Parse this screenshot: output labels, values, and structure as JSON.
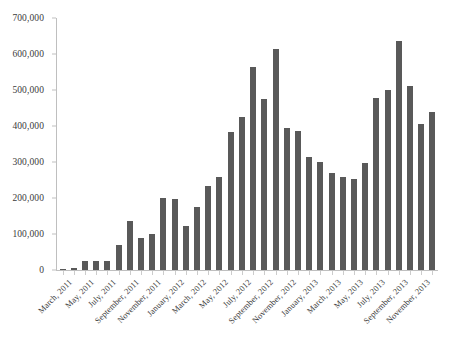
{
  "chart_data": {
    "type": "bar",
    "title": "",
    "subtitle": "",
    "xlabel": "",
    "ylabel": "",
    "ylim": [
      0,
      700000
    ],
    "ytick_values": [
      0,
      100000,
      200000,
      300000,
      400000,
      500000,
      600000,
      700000
    ],
    "ytick_labels": [
      "0",
      "100,000",
      "200,000",
      "300,000",
      "400,000",
      "500,000",
      "600,000",
      "700,000"
    ],
    "grid": false,
    "legend": null,
    "legend_position": "none",
    "bar_color": "#595959",
    "axis_color": "#bfbfbf",
    "text_color": "#3b3b3b",
    "categories": [
      "March, 2011",
      "April, 2011",
      "May, 2011",
      "June, 2011",
      "July, 2011",
      "August, 2011",
      "September, 2011",
      "October, 2011",
      "November, 2011",
      "December, 2011",
      "January, 2012",
      "February, 2012",
      "March, 2012",
      "April, 2012",
      "May, 2012",
      "June, 2012",
      "July, 2012",
      "August, 2012",
      "September, 2012",
      "October, 2012",
      "November, 2012",
      "December, 2012",
      "January, 2013",
      "February, 2013",
      "March, 2013",
      "April, 2013",
      "May, 2013",
      "June, 2013",
      "July, 2013",
      "August, 2013",
      "September, 2013",
      "October, 2013",
      "November, 2013",
      "December, 2013"
    ],
    "values": [
      3000,
      5000,
      25000,
      24000,
      26000,
      70000,
      135000,
      88000,
      100000,
      200000,
      196000,
      122000,
      175000,
      232000,
      258000,
      382000,
      425000,
      565000,
      475000,
      615000,
      395000,
      385000,
      313000,
      300000,
      270000,
      258000,
      252000,
      296000,
      478000,
      500000,
      635000,
      510000,
      405000,
      438000
    ],
    "xtick_labels": [
      "March, 2011",
      "May, 2011",
      "July, 2011",
      "September, 2011",
      "November, 2011",
      "January, 2012",
      "March, 2012",
      "May, 2012",
      "July, 2012",
      "September, 2012",
      "November, 2012",
      "January, 2013",
      "March, 2013",
      "May, 2013",
      "July, 2013",
      "September, 2013",
      "November, 2013"
    ],
    "xtick_category_indices": [
      0,
      2,
      4,
      6,
      8,
      10,
      12,
      14,
      16,
      18,
      20,
      22,
      24,
      26,
      28,
      30,
      32
    ]
  }
}
